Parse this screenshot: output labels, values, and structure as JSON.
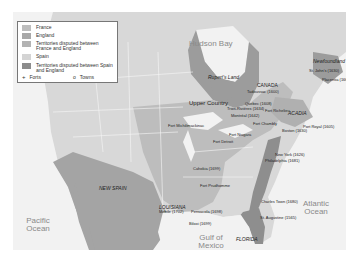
{
  "map": {
    "title": "Colonial North America",
    "colors": {
      "france": "#bdbdbd",
      "england": "#9c9c9c",
      "disputed_france_england": "#b0b0b0",
      "spain": "#d6d6d6",
      "disputed_spain_england": "#8e8e8e",
      "water": "#f2f2f2",
      "land_other": "#dcdcdc"
    },
    "legend": {
      "items": [
        {
          "label": "France",
          "color": "#bdbdbd"
        },
        {
          "label": "England",
          "color": "#a8a8a8"
        },
        {
          "label": "Territories disputed between France and England",
          "color": "#b3b3b3"
        },
        {
          "label": "Spain",
          "color": "#d4d4d4"
        },
        {
          "label": "Territories disputed between Spain and England",
          "color": "#8c8c8c"
        }
      ],
      "forts_label": "Forts",
      "towns_label": "Towns"
    },
    "water_labels": {
      "hudson_bay": "Hudson Bay",
      "pacific": "Pacific Ocean",
      "atlantic": "Atlantic Ocean",
      "gulf": "Gulf of Mexico"
    },
    "regions": {
      "ruperts_land": "Rupert's Land",
      "canada": "CANADA",
      "upper_country": "Upper Country",
      "acadia": "ACADIA",
      "newfoundland": "Newfoundland",
      "new_spain": "NEW SPAIN",
      "louisiana": "LOUISIANA",
      "florida": "FLORIDA"
    },
    "places": [
      {
        "name": "St. John's (1630)",
        "type": "town"
      },
      {
        "name": "Placentia (1662)",
        "type": "town"
      },
      {
        "name": "Tadoussac (1600)",
        "type": "town"
      },
      {
        "name": "Quebec (1608)",
        "type": "town"
      },
      {
        "name": "Trois-Rivières (1634)",
        "type": "town"
      },
      {
        "name": "Fort Richelieu",
        "type": "fort"
      },
      {
        "name": "Montréal (1642)",
        "type": "town"
      },
      {
        "name": "Fort Chambly",
        "type": "fort"
      },
      {
        "name": "Port Royal (1605)",
        "type": "town"
      },
      {
        "name": "Boston (1630)",
        "type": "town"
      },
      {
        "name": "Fort Michilimackinac",
        "type": "fort"
      },
      {
        "name": "Fort Niagara",
        "type": "fort"
      },
      {
        "name": "Fort Detroit",
        "type": "fort"
      },
      {
        "name": "New York (1626)",
        "type": "town"
      },
      {
        "name": "Philadelphia (1681)",
        "type": "town"
      },
      {
        "name": "Cahokia (1699)",
        "type": "town"
      },
      {
        "name": "Fort Prudhomme",
        "type": "fort"
      },
      {
        "name": "Charles Town (1680)",
        "type": "town"
      },
      {
        "name": "Mobile (1702)",
        "type": "town"
      },
      {
        "name": "Pensacola (1698)",
        "type": "town"
      },
      {
        "name": "Biloxi (1699)",
        "type": "town"
      },
      {
        "name": "St. Augustine (1565)",
        "type": "town"
      }
    ]
  }
}
